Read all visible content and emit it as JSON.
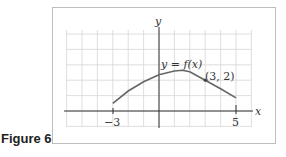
{
  "figure": {
    "caption": "Figure 6"
  },
  "chart_data": {
    "type": "line",
    "title": "",
    "xlabel": "x",
    "ylabel": "y",
    "curve_label": "y = f(x)",
    "annotation": {
      "text": "(3, 2)",
      "x": 3,
      "y": 2
    },
    "x_tick_labels": [
      "-3",
      "5"
    ],
    "xlim": [
      -6,
      6
    ],
    "ylim": [
      -1,
      5.3
    ],
    "grid": true,
    "grid_step": 1,
    "series": [
      {
        "name": "f(x)",
        "x": [
          -3,
          -2,
          -1,
          0,
          1,
          1.5,
          2,
          3,
          4,
          5
        ],
        "y": [
          0.5,
          1.3,
          1.9,
          2.35,
          2.6,
          2.65,
          2.55,
          2.0,
          1.45,
          0.85
        ]
      }
    ],
    "endpoints": [
      {
        "x": -3,
        "y": 0
      },
      {
        "x": 5,
        "y": 0
      }
    ]
  },
  "labels": {
    "y_axis": "y",
    "x_axis": "x",
    "curve": "y = f(x)",
    "point": "(3, 2)",
    "tick_left": "−3",
    "tick_right": "5"
  }
}
